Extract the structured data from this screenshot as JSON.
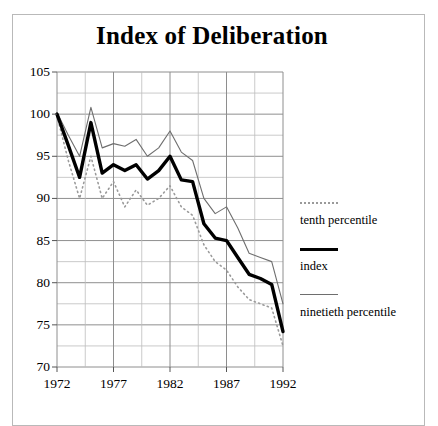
{
  "figure": {
    "title": "Index of Deliberation"
  },
  "legend": {
    "items": [
      {
        "label": "tenth percentile",
        "sample": "dotted-line-sample",
        "style": "dotted"
      },
      {
        "label": "index",
        "sample": "thick-line-sample",
        "style": "thick"
      },
      {
        "label": "ninetieth percentile",
        "sample": "thin-line-sample",
        "style": "thin"
      }
    ]
  },
  "chart_data": {
    "type": "line",
    "title": "Index of Deliberation",
    "xlabel": "",
    "ylabel": "",
    "xlim": [
      1972,
      1992
    ],
    "ylim": [
      70,
      105
    ],
    "ytick_values": [
      70,
      75,
      80,
      85,
      90,
      95,
      100,
      105
    ],
    "ytick_labels": [
      "70",
      "75",
      "80",
      "85",
      "90",
      "95",
      "100",
      "105"
    ],
    "xtick_values": [
      1972,
      1977,
      1982,
      1987,
      1992
    ],
    "xtick_labels": [
      "1972",
      "1977",
      "1982",
      "1987",
      "1992"
    ],
    "minor_gridlines": true,
    "y_minor_step": 2.5,
    "x_minor_step": 2.5,
    "grid": true,
    "legend_position": "right",
    "x": [
      1972,
      1973,
      1974,
      1975,
      1976,
      1977,
      1978,
      1979,
      1980,
      1981,
      1982,
      1983,
      1984,
      1985,
      1986,
      1987,
      1988,
      1989,
      1990,
      1991,
      1992
    ],
    "series": [
      {
        "name": "index",
        "style": "thick",
        "color": "#000000",
        "values": [
          100.0,
          96.3,
          92.5,
          99.0,
          93.0,
          94.0,
          93.3,
          94.0,
          92.3,
          93.3,
          95.0,
          92.2,
          92.0,
          87.0,
          85.3,
          85.0,
          83.0,
          81.0,
          80.5,
          79.8,
          74.2
        ]
      },
      {
        "name": "ninetieth percentile",
        "style": "thin",
        "color": "#6e6e6e",
        "values": [
          100.2,
          97.5,
          95.0,
          100.8,
          96.0,
          96.5,
          96.2,
          97.0,
          95.0,
          96.0,
          98.0,
          95.5,
          94.5,
          90.0,
          88.2,
          89.0,
          86.5,
          83.5,
          83.0,
          82.5,
          77.5
        ]
      },
      {
        "name": "tenth percentile",
        "style": "dotted",
        "color": "#9a9a9a",
        "values": [
          99.8,
          94.5,
          90.0,
          95.0,
          90.0,
          92.0,
          89.0,
          91.0,
          89.2,
          90.0,
          91.5,
          89.0,
          88.0,
          84.5,
          82.5,
          81.5,
          79.5,
          78.0,
          77.5,
          77.0,
          72.5
        ]
      }
    ]
  }
}
